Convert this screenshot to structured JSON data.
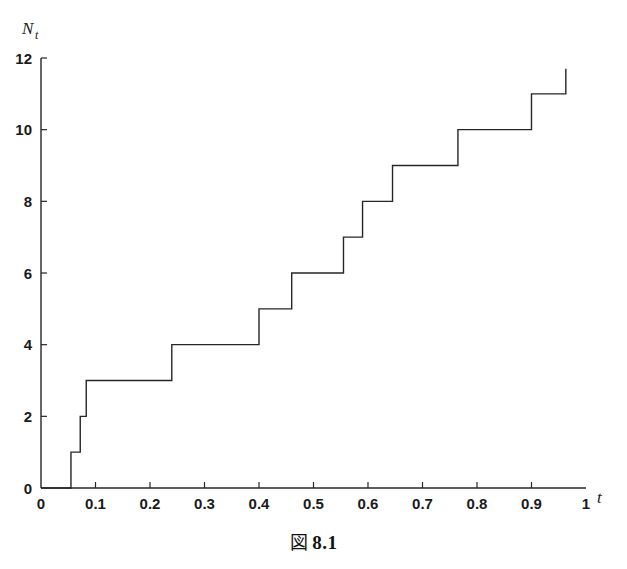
{
  "figure": {
    "caption_symbol": "図",
    "caption_number": "8.1"
  },
  "chart_data": {
    "type": "line",
    "subtype": "step",
    "title": "",
    "subtitle": "",
    "xlabel": "t",
    "ylabel": "N",
    "ylabel_subscript": "t",
    "xlim": [
      0,
      1
    ],
    "ylim": [
      0,
      12
    ],
    "grid": false,
    "legend": null,
    "x_ticks": [
      0,
      0.1,
      0.2,
      0.3,
      0.4,
      0.5,
      0.6,
      0.7,
      0.8,
      0.9,
      1
    ],
    "x_tick_labels": [
      "0",
      "0.1",
      "0.2",
      "0.3",
      "0.4",
      "0.5",
      "0.6",
      "0.7",
      "0.8",
      "0.9",
      "1"
    ],
    "y_ticks": [
      0,
      2,
      4,
      6,
      8,
      10,
      12
    ],
    "y_tick_labels": [
      "0",
      "2",
      "4",
      "6",
      "8",
      "10",
      "12"
    ],
    "line_color": "#262626",
    "line_width": 1.4,
    "jump_times": [
      0.055,
      0.072,
      0.083,
      0.24,
      0.4,
      0.46,
      0.555,
      0.59,
      0.645,
      0.765,
      0.9,
      0.963
    ],
    "jump_values": [
      1,
      2,
      3,
      4,
      5,
      6,
      7,
      8,
      9,
      10,
      11,
      12
    ],
    "x": [
      0,
      0.055,
      0.055,
      0.072,
      0.072,
      0.083,
      0.083,
      0.24,
      0.24,
      0.4,
      0.4,
      0.46,
      0.46,
      0.555,
      0.555,
      0.59,
      0.59,
      0.645,
      0.645,
      0.765,
      0.765,
      0.9,
      0.9,
      0.963,
      0.963
    ],
    "y": [
      0,
      0,
      1,
      1,
      2,
      2,
      3,
      3,
      4,
      4,
      5,
      5,
      6,
      6,
      7,
      7,
      8,
      8,
      9,
      9,
      10,
      10,
      11,
      11,
      11.7
    ],
    "series": [
      {
        "name": "N_t",
        "points": [
          {
            "t": 0.0,
            "n": 0
          },
          {
            "t": 0.055,
            "n": 1
          },
          {
            "t": 0.072,
            "n": 2
          },
          {
            "t": 0.083,
            "n": 3
          },
          {
            "t": 0.24,
            "n": 4
          },
          {
            "t": 0.4,
            "n": 5
          },
          {
            "t": 0.46,
            "n": 6
          },
          {
            "t": 0.555,
            "n": 7
          },
          {
            "t": 0.59,
            "n": 8
          },
          {
            "t": 0.645,
            "n": 9
          },
          {
            "t": 0.765,
            "n": 10
          },
          {
            "t": 0.9,
            "n": 11
          },
          {
            "t": 0.963,
            "n": 12
          }
        ]
      }
    ]
  }
}
